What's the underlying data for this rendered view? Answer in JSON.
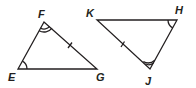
{
  "diagram": {
    "type": "congruent-triangles",
    "stroke_color": "#231f20",
    "triangles": [
      {
        "name": "triangle-EFG",
        "vertices": [
          {
            "id": "F",
            "label": "F",
            "x": 44,
            "y": 22,
            "lx": 42,
            "ly": 14
          },
          {
            "id": "E",
            "label": "E",
            "x": 18,
            "y": 69,
            "lx": 11,
            "ly": 79
          },
          {
            "id": "G",
            "label": "G",
            "x": 97,
            "y": 69,
            "lx": 99,
            "ly": 79
          }
        ],
        "angle_marks": [
          {
            "vertex": "E",
            "arcs": 1
          },
          {
            "vertex": "F",
            "arcs": 2
          }
        ],
        "side_ticks": [
          {
            "side": "FG",
            "ticks": 1
          }
        ]
      },
      {
        "name": "triangle-KHJ",
        "vertices": [
          {
            "id": "K",
            "label": "K",
            "x": 97,
            "y": 20,
            "lx": 90,
            "ly": 15
          },
          {
            "id": "H",
            "label": "H",
            "x": 177,
            "y": 20,
            "lx": 178,
            "ly": 14
          },
          {
            "id": "J",
            "label": "J",
            "x": 150,
            "y": 69,
            "lx": 147,
            "ly": 82
          }
        ],
        "angle_marks": [
          {
            "vertex": "H",
            "arcs": 1
          },
          {
            "vertex": "J",
            "arcs": 2
          }
        ],
        "side_ticks": [
          {
            "side": "KJ",
            "ticks": 1
          }
        ]
      }
    ],
    "labels": {
      "F": "F",
      "E": "E",
      "G": "G",
      "K": "K",
      "H": "H",
      "J": "J"
    }
  }
}
